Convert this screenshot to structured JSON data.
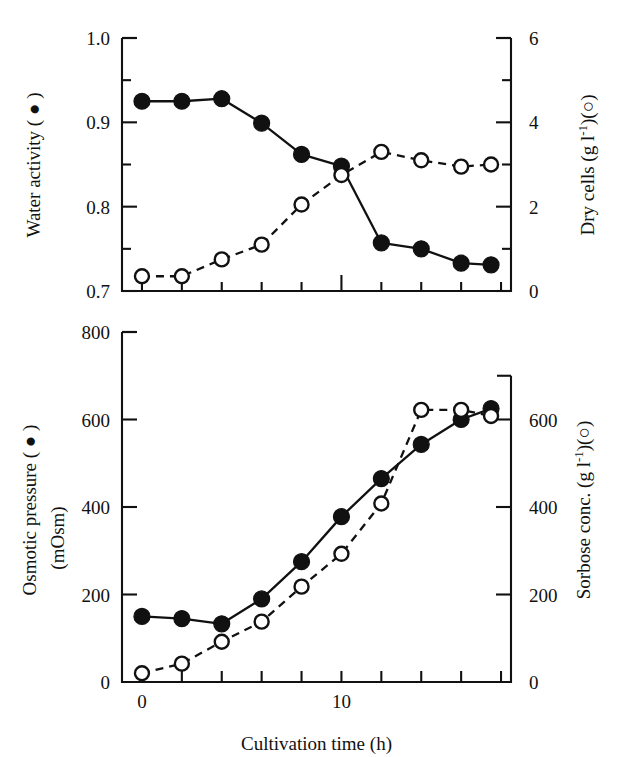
{
  "figure": {
    "xlabel": "Cultivation time (h)",
    "background": "#ffffff",
    "ink": "#111111"
  },
  "chart_data": [
    {
      "type": "line",
      "panel": "top",
      "title": "",
      "xlabel": "Cultivation time (h)",
      "xlim": [
        -1,
        18.5
      ],
      "xticks": [
        0,
        2,
        4,
        6,
        8,
        10,
        12,
        14,
        16,
        18
      ],
      "xticklabels": [
        "",
        "",
        "",
        "",
        "",
        "",
        "",
        "",
        "",
        ""
      ],
      "grid": false,
      "legend": "none",
      "left_axis": {
        "label": "Water activity ( ● )",
        "ylabel_plain": "Water activity",
        "marker": "filled-circle",
        "ylim": [
          0.7,
          1.0
        ],
        "yticks": [
          0.7,
          0.8,
          0.9,
          1.0
        ],
        "yticklabels": [
          "0.7",
          "0.8",
          "0.9",
          "1.0"
        ],
        "minor_ticks": [
          0.75,
          0.85,
          0.95
        ]
      },
      "right_axis": {
        "label": "Dry cells (g l⁻¹)(○)",
        "ylabel_plain": "Dry cells",
        "unit_base": "Dry cells (g l",
        "unit_sup": "-1",
        "unit_tail": ")(○)",
        "marker": "open-circle",
        "ylim": [
          0,
          6
        ],
        "yticks": [
          0,
          2,
          4,
          6
        ],
        "yticklabels": [
          "0",
          "2",
          "4",
          "6"
        ],
        "minor_ticks": [
          1,
          3,
          5
        ]
      },
      "series": [
        {
          "name": "Water activity",
          "marker": "filled-circle",
          "linestyle": "solid",
          "axis": "left",
          "x": [
            0,
            2,
            4,
            6,
            8,
            10,
            12,
            14,
            16,
            17.5
          ],
          "values": [
            0.925,
            0.925,
            0.928,
            0.899,
            0.862,
            0.848,
            0.757,
            0.75,
            0.733,
            0.731
          ]
        },
        {
          "name": "Dry cells",
          "marker": "open-circle",
          "linestyle": "dashed",
          "axis": "right",
          "x": [
            0,
            2,
            4,
            6,
            8,
            10,
            12,
            14,
            16,
            17.5
          ],
          "values": [
            0.35,
            0.35,
            0.75,
            1.1,
            2.05,
            2.75,
            3.3,
            3.1,
            2.95,
            3.0
          ]
        }
      ]
    },
    {
      "type": "line",
      "panel": "bottom",
      "title": "",
      "xlabel": "Cultivation time (h)",
      "xlim": [
        -1,
        18.5
      ],
      "xticks": [
        0,
        2,
        4,
        6,
        8,
        10,
        12,
        14,
        16,
        18
      ],
      "xticklabels": [
        "0",
        "",
        "",
        "",
        "",
        "10",
        "",
        "",
        "",
        ""
      ],
      "grid": false,
      "legend": "none",
      "left_axis": {
        "label": "Osmotic pressure ( ● )",
        "label_line2": "(mOsm)",
        "marker": "filled-circle",
        "ylim": [
          0,
          800
        ],
        "yticks": [
          0,
          200,
          400,
          600,
          800
        ],
        "yticklabels": [
          "0",
          "200",
          "400",
          "600",
          "800"
        ],
        "minor_ticks": [
          100,
          300,
          500,
          700
        ]
      },
      "right_axis": {
        "label": "Sorbose conc. (g l⁻¹)(○)",
        "unit_base": "Sorbose conc. (g l",
        "unit_sup": "-1",
        "unit_tail": ")(○)",
        "marker": "open-circle",
        "ylim": [
          0,
          700
        ],
        "yticks": [
          0,
          200,
          400,
          600
        ],
        "yticklabels": [
          "0",
          "200",
          "400",
          "600"
        ],
        "minor_ticks": [
          100,
          300,
          500,
          700
        ]
      },
      "series": [
        {
          "name": "Osmotic pressure",
          "marker": "filled-circle",
          "linestyle": "solid",
          "axis": "left",
          "x": [
            0,
            2,
            4,
            6,
            8,
            10,
            12,
            14,
            16,
            17.5
          ],
          "values": [
            150,
            145,
            133,
            190,
            275,
            378,
            465,
            543,
            600,
            625
          ]
        },
        {
          "name": "Sorbose conc.",
          "marker": "open-circle",
          "linestyle": "dashed",
          "axis": "right",
          "x": [
            0,
            2,
            4,
            6,
            8,
            10,
            12,
            14,
            16,
            17.5
          ],
          "values": [
            20,
            42,
            92,
            138,
            218,
            293,
            408,
            622,
            622,
            608
          ]
        }
      ]
    }
  ]
}
